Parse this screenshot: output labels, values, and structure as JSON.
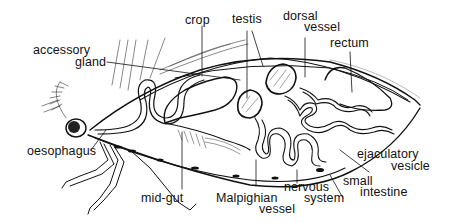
{
  "diagram": {
    "line_color": "#111111",
    "background": "#ffffff",
    "labels": {
      "crop": "crop",
      "testis": "testis",
      "dorsal_vessel_1": "dorsal",
      "dorsal_vessel_2": "vessel",
      "rectum": "rectum",
      "accessory_gland_1": "accessory",
      "accessory_gland_2": "gland",
      "oesophagus": "oesophagus",
      "mid_gut": "mid-gut",
      "malpighian_vessel_1": "Malpighian",
      "malpighian_vessel_2": "vessel",
      "nervous_system_1": "nervous",
      "nervous_system_2": "system",
      "small_intestine_1": "small",
      "small_intestine_2": "intestine",
      "ejaculatory_vesicle_1": "ejaculatory",
      "ejaculatory_vesicle_2": "vesicle"
    }
  }
}
